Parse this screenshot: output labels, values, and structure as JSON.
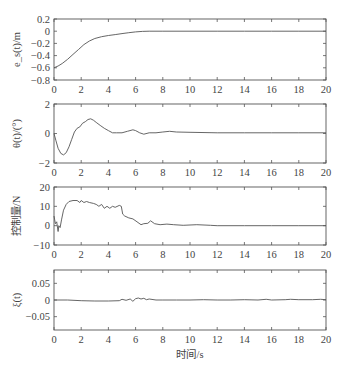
{
  "chart_data": [
    {
      "type": "line",
      "title": "",
      "xlabel": "",
      "ylabel": "e_s(t)/m",
      "xlim": [
        0,
        20
      ],
      "ylim": [
        -0.8,
        0.2
      ],
      "xticks": [
        0,
        2,
        4,
        6,
        8,
        10,
        12,
        14,
        16,
        18,
        20
      ],
      "xtick_labels": [
        "0",
        "2",
        "4",
        "6",
        "8",
        "10",
        "12",
        "14",
        "16",
        "18",
        "20"
      ],
      "yticks": [
        -0.8,
        -0.6,
        -0.4,
        -0.2,
        0,
        0.2
      ],
      "ytick_labels": [
        "-0.8",
        "-0.6",
        "-0.4",
        "-0.2",
        "0",
        "0.2"
      ],
      "grid": false,
      "series": [
        {
          "name": "e_s(t)",
          "x": [
            0,
            0.3,
            0.6,
            1.0,
            1.4,
            1.8,
            2.2,
            2.6,
            3.0,
            3.5,
            4.0,
            4.5,
            5.0,
            5.5,
            6.0,
            6.5,
            7.0,
            8.0,
            10,
            12,
            14,
            16,
            18,
            20
          ],
          "y": [
            -0.6,
            -0.57,
            -0.53,
            -0.46,
            -0.38,
            -0.3,
            -0.22,
            -0.16,
            -0.12,
            -0.09,
            -0.07,
            -0.055,
            -0.04,
            -0.025,
            -0.012,
            -0.003,
            0,
            0,
            0,
            0,
            0,
            0,
            0,
            0
          ]
        }
      ]
    },
    {
      "type": "line",
      "title": "",
      "xlabel": "",
      "ylabel": "θ(t)/(°)",
      "xlim": [
        0,
        20
      ],
      "ylim": [
        -2,
        2
      ],
      "xticks": [
        0,
        2,
        4,
        6,
        8,
        10,
        12,
        14,
        16,
        18,
        20
      ],
      "xtick_labels": [
        "0",
        "2",
        "4",
        "6",
        "8",
        "10",
        "12",
        "14",
        "16",
        "18",
        "20"
      ],
      "yticks": [
        -2,
        0,
        2
      ],
      "ytick_labels": [
        "-2",
        "0",
        "2"
      ],
      "grid": false,
      "series": [
        {
          "name": "θ(t)",
          "x": [
            0,
            0.15,
            0.3,
            0.5,
            0.7,
            0.9,
            1.1,
            1.3,
            1.5,
            1.7,
            1.9,
            2.1,
            2.3,
            2.5,
            2.7,
            2.9,
            3.1,
            3.4,
            3.7,
            4.0,
            4.3,
            4.6,
            5.0,
            5.4,
            5.8,
            6.0,
            6.3,
            6.6,
            7.0,
            7.5,
            8.0,
            8.5,
            9,
            10,
            12,
            14,
            16,
            18,
            20
          ],
          "y": [
            0,
            -0.5,
            -1.0,
            -1.35,
            -1.45,
            -1.3,
            -0.9,
            -0.4,
            0.1,
            0.35,
            0.45,
            0.7,
            0.8,
            0.95,
            1.0,
            0.9,
            0.75,
            0.55,
            0.35,
            0.2,
            0.05,
            0.05,
            0.05,
            0.15,
            0.25,
            0.2,
            0.05,
            -0.05,
            0.05,
            0.05,
            0.1,
            0.15,
            0.1,
            0.08,
            0.05,
            0.05,
            0.05,
            0.05,
            0.05
          ]
        }
      ]
    },
    {
      "type": "line",
      "title": "",
      "xlabel": "",
      "ylabel": "控制量/N",
      "xlim": [
        0,
        20
      ],
      "ylim": [
        -10,
        20
      ],
      "xticks": [
        0,
        2,
        4,
        6,
        8,
        10,
        12,
        14,
        16,
        18,
        20
      ],
      "xtick_labels": [
        "0",
        "2",
        "4",
        "6",
        "8",
        "10",
        "12",
        "14",
        "16",
        "18",
        "20"
      ],
      "yticks": [
        -10,
        0,
        10,
        20
      ],
      "ytick_labels": [
        "-10",
        "0",
        "10",
        "20"
      ],
      "grid": false,
      "series": [
        {
          "name": "control",
          "x": [
            0,
            0.05,
            0.1,
            0.2,
            0.3,
            0.35,
            0.45,
            0.55,
            0.7,
            0.9,
            1.1,
            1.4,
            1.7,
            1.9,
            2.0,
            2.2,
            2.4,
            2.6,
            2.9,
            3.1,
            3.3,
            3.5,
            3.7,
            3.9,
            4.1,
            4.3,
            4.5,
            4.8,
            4.95,
            5.05,
            5.2,
            5.5,
            5.8,
            6.1,
            6.4,
            6.6,
            6.9,
            7.1,
            7.4,
            7.8,
            8.3,
            8.8,
            9.5,
            10.5,
            11.5,
            12,
            14,
            16,
            18,
            20
          ],
          "y": [
            5,
            3,
            1,
            2,
            -3,
            0,
            -1,
            3,
            8,
            11,
            12.5,
            13,
            13,
            12,
            13,
            12,
            12.5,
            12,
            11.5,
            11,
            10,
            11,
            9,
            10,
            9,
            10,
            9.5,
            10.5,
            10,
            6,
            5,
            4,
            3.5,
            2,
            0.5,
            1,
            1.2,
            2.5,
            1,
            0.5,
            0.8,
            0.5,
            0.2,
            0.5,
            0.2,
            0,
            0,
            0,
            0,
            0
          ]
        }
      ]
    },
    {
      "type": "line",
      "title": "",
      "xlabel": "时间/s",
      "ylabel": "ξ(t)",
      "xlim": [
        0,
        20
      ],
      "ylim": [
        -0.09,
        0.09
      ],
      "xticks": [
        0,
        2,
        4,
        6,
        8,
        10,
        12,
        14,
        16,
        18,
        20
      ],
      "xtick_labels": [
        "0",
        "2",
        "4",
        "6",
        "8",
        "10",
        "12",
        "14",
        "16",
        "18",
        "20"
      ],
      "yticks": [
        -0.05,
        0,
        0.05
      ],
      "ytick_labels": [
        "-0.05",
        "0",
        "0.05"
      ],
      "grid": false,
      "series": [
        {
          "name": "ξ(t)",
          "x": [
            0,
            1,
            2,
            3,
            4,
            4.8,
            5.0,
            5.3,
            5.6,
            5.8,
            6.0,
            6.2,
            6.4,
            6.6,
            6.8,
            7.0,
            7.5,
            8,
            9,
            10,
            11,
            12,
            13,
            14,
            15,
            15.6,
            16,
            17,
            17.4,
            18,
            19,
            19.6,
            20
          ],
          "y": [
            0,
            0,
            -0.002,
            -0.003,
            -0.003,
            -0.002,
            0.002,
            -0.001,
            0.003,
            -0.004,
            0.004,
            0.006,
            0.003,
            0.005,
            0.001,
            0.003,
            0,
            0,
            0,
            0,
            0.001,
            0,
            0,
            0.001,
            0,
            0.002,
            0,
            0.001,
            0.002,
            0.001,
            0.001,
            0.002,
            0.001
          ]
        }
      ]
    }
  ]
}
